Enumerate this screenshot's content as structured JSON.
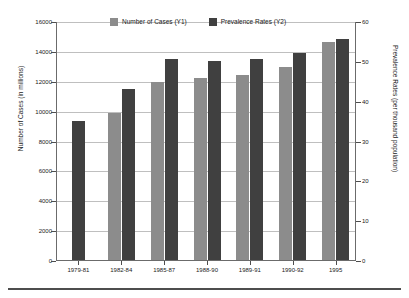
{
  "chart_data": {
    "type": "bar",
    "title": "",
    "categories": [
      "1979-81",
      "1982-84",
      "1985-87",
      "1988-90",
      "1989-91",
      "1990-92",
      "1995"
    ],
    "series": [
      {
        "name": "Number of Cases (Y1)",
        "axis": "left",
        "color": "#8c8c8c",
        "values": [
          null,
          9850,
          11950,
          12200,
          12400,
          12900,
          14600
        ]
      },
      {
        "name": "Prevalence Rates (Y2)",
        "axis": "right",
        "color": "#404040",
        "values": [
          35.0,
          43.0,
          50.5,
          50.0,
          50.5,
          52.0,
          55.5
        ]
      }
    ],
    "xlabel": "",
    "ylabel": "Number of Cases (in millions)",
    "ylabel_right": "Prevalence Rates (per thousand population)",
    "ylim": [
      0,
      16000
    ],
    "ylim_right": [
      0,
      60
    ],
    "yticks": [
      "0",
      "2000",
      "4000",
      "6000",
      "8000",
      "10000",
      "12000",
      "14000",
      "16000"
    ],
    "yticks_right": [
      "0",
      "10",
      "20",
      "30",
      "40",
      "50",
      "60"
    ],
    "grid": true,
    "legend_position": "top-center"
  },
  "legend": {
    "items": [
      {
        "label": "Number of Cases (Y1)",
        "color": "#8c8c8c"
      },
      {
        "label": "Prevalence Rates (Y2)",
        "color": "#404040"
      }
    ]
  },
  "axes": {
    "left_title": "Number of Cases (in millions)",
    "right_title": "Prevalence Rates (per thousand population)"
  }
}
